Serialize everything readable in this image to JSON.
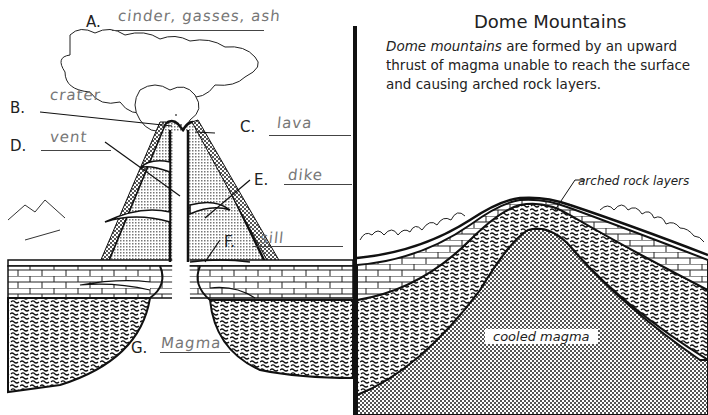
{
  "volcano": {
    "labels": [
      {
        "letter": "A.",
        "answer": "cinder, gasses, ash"
      },
      {
        "letter": "B.",
        "answer": "crater"
      },
      {
        "letter": "C.",
        "answer": "lava"
      },
      {
        "letter": "D.",
        "answer": "vent"
      },
      {
        "letter": "E.",
        "answer": "dike"
      },
      {
        "letter": "F.",
        "answer": "sill"
      },
      {
        "letter": "G.",
        "answer": "Magma"
      }
    ]
  },
  "dome": {
    "title": "Dome Mountains",
    "description_italic": "Dome mountains",
    "description_rest": " are formed by an upward thrust of magma unable to reach the surface and causing arched rock layers.",
    "arched_label": "arched rock layers",
    "magma_label": "cooled magma"
  },
  "colors": {
    "line": "#111111",
    "stipple": "#bdbdbd",
    "answer_ink": "#777777"
  }
}
